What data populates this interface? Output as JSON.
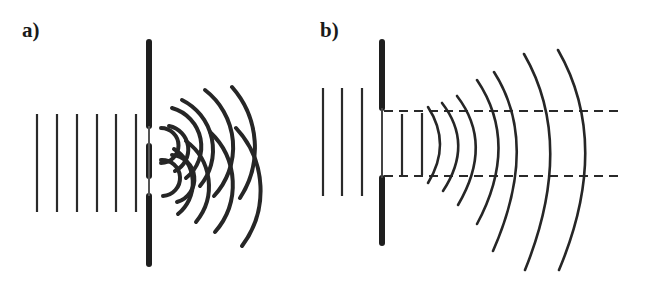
{
  "panels": [
    {
      "id": "a",
      "label": "a)",
      "description": "Plane waves passing through a double slit produce interfering circular wavefronts"
    },
    {
      "id": "b",
      "label": "b)",
      "description": "Plane waves passing through a single wide aperture spread out as curved wavefronts bounded by dashed geometric-shadow lines"
    }
  ]
}
